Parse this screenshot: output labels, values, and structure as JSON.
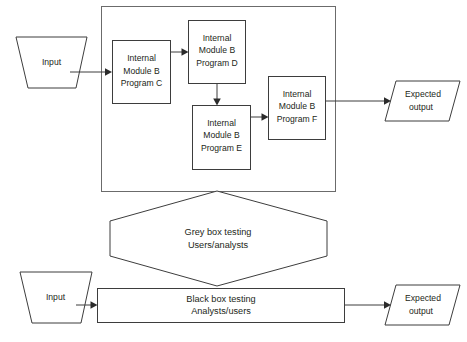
{
  "diagram": {
    "type": "flowchart",
    "title_clipped": "",
    "background_color": "#ffffff",
    "stroke_color": "#3d3d3d",
    "container_stroke_color": "#6b6b6b",
    "text_color": "#231f20",
    "rows": {
      "top_row_label": "White/grey box internal view",
      "bottom_row_label": "Black box external view"
    },
    "nodes": {
      "input_top": {
        "label": "Input",
        "shape": "trapezoid"
      },
      "module_c": {
        "line1": "Internal",
        "line2": "Module B",
        "line3": "Program C",
        "shape": "rectangle"
      },
      "module_d": {
        "line1": "Internal",
        "line2": "Module B",
        "line3": "Program D",
        "shape": "rectangle"
      },
      "module_e": {
        "line1": "Internal",
        "line2": "Module B",
        "line3": "Program E",
        "shape": "rectangle"
      },
      "module_f": {
        "line1": "Internal",
        "line2": "Module B",
        "line3": "Program F",
        "shape": "rectangle"
      },
      "expected_output_top": {
        "line1": "Expected",
        "line2": "output",
        "shape": "parallelogram"
      },
      "grey_box": {
        "line1": "Grey box testing",
        "line2": "Users/analysts",
        "shape": "hexagon"
      },
      "input_bottom": {
        "label": "Input",
        "shape": "trapezoid"
      },
      "black_box": {
        "line1": "Black box testing",
        "line2": "Analysts/users",
        "shape": "rectangle"
      },
      "expected_output_bottom": {
        "line1": "Expected",
        "line2": "output",
        "shape": "parallelogram"
      }
    },
    "edges": [
      {
        "from": "input_top",
        "to": "module_c",
        "style": "arrow"
      },
      {
        "from": "module_c",
        "to": "module_d",
        "style": "arrow"
      },
      {
        "from": "module_d",
        "to": "module_e",
        "style": "arrow"
      },
      {
        "from": "module_e",
        "to": "module_f",
        "style": "arrow"
      },
      {
        "from": "module_f",
        "to": "expected_output_top",
        "style": "arrow"
      },
      {
        "from": "input_bottom",
        "to": "black_box",
        "style": "arrow"
      },
      {
        "from": "black_box",
        "to": "expected_output_bottom",
        "style": "arrow"
      }
    ]
  }
}
